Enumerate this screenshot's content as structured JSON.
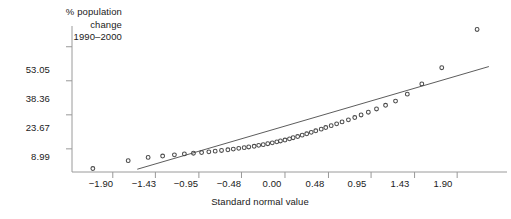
{
  "chart_data": {
    "type": "scatter",
    "title": "",
    "ylabel_lines": [
      "% population",
      "change",
      "1990–2000"
    ],
    "xlabel": "Standard normal value",
    "ytick_labels": [
      "53.05",
      "38.36",
      "23.67",
      "8.99"
    ],
    "ytick_values": [
      53.05,
      38.36,
      23.67,
      8.99
    ],
    "xtick_labels": [
      "−1.90",
      "−1.43",
      "−0.95",
      "−0.48",
      "0.00",
      "0.48",
      "0.95",
      "1.43",
      "1.90"
    ],
    "xtick_values": [
      -1.9,
      -1.43,
      -0.95,
      -0.48,
      0.0,
      0.48,
      0.95,
      1.43,
      1.9
    ],
    "xlim": [
      -2.35,
      2.45
    ],
    "ylim": [
      -1.0,
      62.0
    ],
    "grid": false,
    "legend": null,
    "marker": "open-circle",
    "marker_color": "#4a4a4a",
    "axis_color": "#999999",
    "reference_line": {
      "label": "normal reference line",
      "x": [
        -1.63,
        2.25
      ],
      "y": [
        0.2,
        44.5
      ]
    },
    "x": [
      -2.12,
      -1.73,
      -1.51,
      -1.35,
      -1.22,
      -1.11,
      -1.01,
      -0.92,
      -0.84,
      -0.77,
      -0.7,
      -0.63,
      -0.57,
      -0.51,
      -0.45,
      -0.4,
      -0.34,
      -0.29,
      -0.24,
      -0.19,
      -0.14,
      -0.09,
      -0.05,
      0.0,
      0.05,
      0.09,
      0.14,
      0.19,
      0.24,
      0.29,
      0.34,
      0.4,
      0.45,
      0.51,
      0.57,
      0.63,
      0.7,
      0.77,
      0.84,
      0.92,
      1.01,
      1.11,
      1.22,
      1.35,
      1.51,
      1.73,
      2.12
    ],
    "y": [
      0.5,
      3.9,
      5.3,
      5.9,
      6.4,
      6.8,
      7.1,
      7.4,
      7.7,
      8.0,
      8.3,
      8.6,
      8.9,
      9.2,
      9.5,
      9.8,
      10.1,
      10.5,
      10.8,
      11.2,
      11.6,
      12.0,
      12.4,
      12.8,
      13.3,
      13.8,
      14.3,
      14.9,
      15.5,
      16.1,
      16.8,
      17.5,
      18.2,
      19.0,
      19.8,
      20.6,
      21.5,
      22.5,
      23.6,
      24.8,
      26.2,
      27.8,
      29.6,
      32.6,
      37.0,
      44.0,
      60.5
    ]
  }
}
